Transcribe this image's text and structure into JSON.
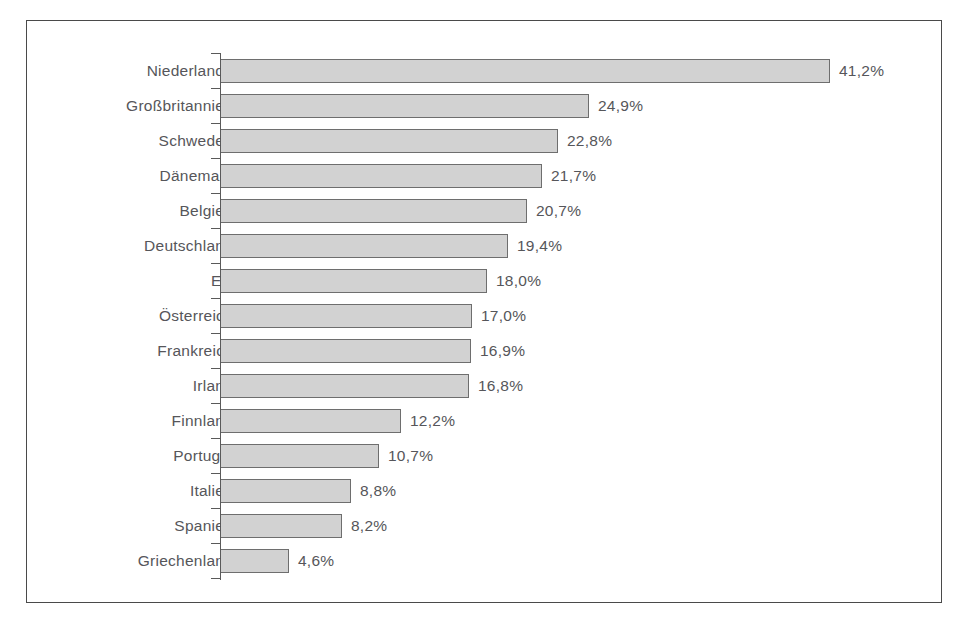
{
  "chart_data": {
    "type": "bar",
    "orientation": "horizontal",
    "title": "",
    "subtitle": "",
    "xlabel": "",
    "ylabel": "",
    "grid": false,
    "legend": null,
    "xlim": [
      0,
      41.2
    ],
    "value_suffix": "%",
    "decimal_separator": ",",
    "categories": [
      "Niederlande",
      "Großbritannien",
      "Schweden",
      "Dänemark",
      "Belgien",
      "Deutschland",
      "EU",
      "Österreich",
      "Frankreich",
      "Irland",
      "Finnland",
      "Portugal",
      "Italien",
      "Spanien",
      "Griechenland"
    ],
    "values": [
      41.2,
      24.9,
      22.8,
      21.7,
      20.7,
      19.4,
      18.0,
      17.0,
      16.9,
      16.8,
      12.2,
      10.7,
      8.8,
      8.2,
      4.6
    ],
    "value_labels": [
      "41,2%",
      "24,9%",
      "22,8%",
      "21,7%",
      "20,7%",
      "19,4%",
      "18,0%",
      "17,0%",
      "16,9%",
      "16,8%",
      "12,2%",
      "10,7%",
      "8,8%",
      "8,2%",
      "4,6%"
    ],
    "bars": [
      {
        "label": "Niederlande",
        "value": 41.2,
        "value_label": "41,2%"
      },
      {
        "label": "Großbritannien",
        "value": 24.9,
        "value_label": "24,9%"
      },
      {
        "label": "Schweden",
        "value": 22.8,
        "value_label": "22,8%"
      },
      {
        "label": "Dänemark",
        "value": 21.7,
        "value_label": "21,7%"
      },
      {
        "label": "Belgien",
        "value": 20.7,
        "value_label": "20,7%"
      },
      {
        "label": "Deutschland",
        "value": 19.4,
        "value_label": "19,4%"
      },
      {
        "label": "EU",
        "value": 18.0,
        "value_label": "18,0%"
      },
      {
        "label": "Österreich",
        "value": 17.0,
        "value_label": "17,0%"
      },
      {
        "label": "Frankreich",
        "value": 16.9,
        "value_label": "16,9%"
      },
      {
        "label": "Irland",
        "value": 16.8,
        "value_label": "16,8%"
      },
      {
        "label": "Finnland",
        "value": 12.2,
        "value_label": "12,2%"
      },
      {
        "label": "Portugal",
        "value": 10.7,
        "value_label": "10,7%"
      },
      {
        "label": "Italien",
        "value": 8.8,
        "value_label": "8,8%"
      },
      {
        "label": "Spanien",
        "value": 8.2,
        "value_label": "8,2%"
      },
      {
        "label": "Griechenland",
        "value": 4.6,
        "value_label": "4,6%"
      }
    ],
    "colors": {
      "bar_fill": "#d2d2d2",
      "bar_stroke": "#6e6e6e",
      "axis": "#5a5a5a",
      "text": "#56565a",
      "frame": "#4a4a4a",
      "background": "#ffffff"
    },
    "geometry": {
      "px_per_unit": 14.78,
      "bar_height_px": 24,
      "row_pitch_px": 35,
      "axis_x_px": 219,
      "first_row_top_px": 52
    }
  }
}
